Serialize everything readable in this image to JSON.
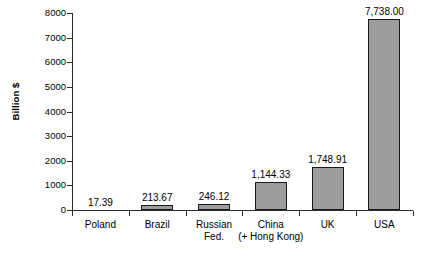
{
  "chart_data": {
    "type": "bar",
    "title": "",
    "xlabel": "",
    "ylabel": "Billion $",
    "ylim": [
      0,
      8000
    ],
    "grid": false,
    "legend": false,
    "categories": [
      "Poland",
      "Brazil",
      "Russian Fed.",
      "China (+ Hong Kong)",
      "UK",
      "USA"
    ],
    "category_lines": [
      [
        "Poland",
        ""
      ],
      [
        "Brazil",
        ""
      ],
      [
        "Russian",
        "Fed."
      ],
      [
        "China",
        "(+ Hong Kong)"
      ],
      [
        "UK",
        ""
      ],
      [
        "USA",
        ""
      ]
    ],
    "values": [
      17.39,
      213.67,
      246.12,
      1144.33,
      1748.91,
      7738.0
    ],
    "value_labels": [
      "17.39",
      "213.67",
      "246.12",
      "1,144.33",
      "1,748.91",
      "7,738.00"
    ],
    "yticks": [
      0,
      1000,
      2000,
      3000,
      4000,
      5000,
      6000,
      7000,
      8000
    ],
    "ytick_labels": [
      "0",
      "1000",
      "2000",
      "3000",
      "4000",
      "5000",
      "6000",
      "7000",
      "8000"
    ],
    "colors": {
      "bar_fill": "#9d9d9d",
      "bar_border": "#1a1a1a",
      "axis": "#2b2b2b",
      "text": "#000000",
      "background": "#ffffff"
    }
  }
}
